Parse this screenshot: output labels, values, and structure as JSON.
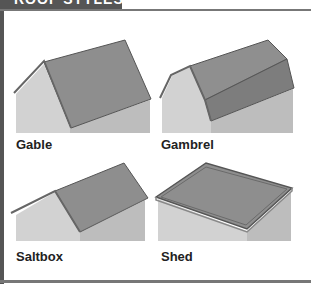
{
  "title": "ROOF STYLES",
  "styles": [
    {
      "name": "Gable"
    },
    {
      "name": "Gambrel"
    },
    {
      "name": "Saltbox"
    },
    {
      "name": "Shed"
    }
  ],
  "colors": {
    "frame": "#555555",
    "roof": "#8e8e8e",
    "wall_front": "#d2d2d2",
    "wall_side": "#bdbdbd",
    "label": "#222222"
  }
}
